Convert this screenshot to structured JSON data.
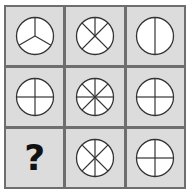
{
  "puzzle": {
    "rows": 3,
    "cols": 3,
    "colors": {
      "grid_line": "#6e6e6e",
      "cell_bg": "#dcdcdc",
      "circle_fill": "#ffffff",
      "stroke": "#333333"
    },
    "cells": [
      {
        "row": 1,
        "col": 1,
        "type": "circle",
        "segments": 3,
        "angles": [
          0,
          120,
          240
        ]
      },
      {
        "row": 1,
        "col": 2,
        "type": "circle",
        "segments": 5,
        "angles": [
          0,
          45,
          135,
          225,
          315
        ]
      },
      {
        "row": 1,
        "col": 3,
        "type": "circle",
        "segments": 2,
        "angles": [
          0,
          180
        ]
      },
      {
        "row": 2,
        "col": 1,
        "type": "circle",
        "segments": 4,
        "angles": [
          0,
          90,
          180,
          270
        ]
      },
      {
        "row": 2,
        "col": 2,
        "type": "circle",
        "segments": 8,
        "angles": [
          0,
          45,
          90,
          135,
          180,
          225,
          270,
          315
        ]
      },
      {
        "row": 2,
        "col": 3,
        "type": "circle",
        "segments": 4,
        "angles": [
          0,
          90,
          180,
          270
        ]
      },
      {
        "row": 3,
        "col": 1,
        "type": "question",
        "label": "?"
      },
      {
        "row": 3,
        "col": 2,
        "type": "circle",
        "segments": 6,
        "angles": [
          0,
          45,
          135,
          180,
          225,
          315
        ]
      },
      {
        "row": 3,
        "col": 3,
        "type": "circle",
        "segments": 4,
        "angles": [
          0,
          90,
          180,
          270
        ]
      }
    ]
  }
}
